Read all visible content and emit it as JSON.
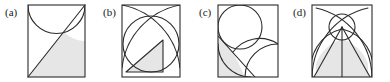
{
  "figure": {
    "type": "geometry-diagram-panels",
    "background_color": "#ffffff",
    "stroke_color": "#2b2b2b",
    "shade_color": "#e6e6e6",
    "panel_count": 4,
    "panels": [
      {
        "id": "a",
        "label": "(a)",
        "description": "Square with a circle tangent to the top side and a diagonal from bottom-left to top-right; region below the diagonal and outside the circle is shaded.",
        "shapes": [
          "square",
          "circle",
          "diagonal-line"
        ],
        "shaded_regions": 1
      },
      {
        "id": "b",
        "label": "(b)",
        "description": "Square with an inscribed circle, two quarter-arcs centered at the bottom corners crossing near the top, and a shaded triangle inside the circle.",
        "shapes": [
          "square",
          "inscribed-circle",
          "arc",
          "arc",
          "triangle"
        ],
        "shaded_regions": 1
      },
      {
        "id": "c",
        "label": "(c)",
        "description": "Square with a small circle tangent to the top-left, a large quarter-arc from the bottom-right, and a diagonal line; small lens region shaded.",
        "shapes": [
          "square",
          "circle",
          "quarter-arc",
          "diagonal-line"
        ],
        "shaded_regions": 1
      },
      {
        "id": "d",
        "label": "(d)",
        "description": "Square with two large crossing arcs, a small circle near the top, a vertical center line and two slanted lines; lower central region shaded.",
        "shapes": [
          "square",
          "arc",
          "arc",
          "circle",
          "vertical-line",
          "slant-line",
          "slant-line"
        ],
        "shaded_regions": 1
      }
    ]
  }
}
